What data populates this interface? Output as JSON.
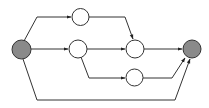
{
  "diagram": {
    "type": "directed-graph",
    "width": 209,
    "height": 108,
    "colors": {
      "stroke": "#333333",
      "terminal_fill": "#8a8a8a",
      "inner_fill": "#ffffff",
      "background": "#ffffff"
    },
    "nodes": [
      {
        "id": "source",
        "kind": "terminal",
        "cx": 21.5,
        "cy": 49.5,
        "r": 9.5
      },
      {
        "id": "n1",
        "kind": "inner",
        "cx": 80.5,
        "cy": 17,
        "r": 8.5
      },
      {
        "id": "n2",
        "kind": "inner",
        "cx": 78,
        "cy": 49,
        "r": 9
      },
      {
        "id": "n3",
        "kind": "inner",
        "cx": 135,
        "cy": 49,
        "r": 9
      },
      {
        "id": "n4",
        "kind": "inner",
        "cx": 134.5,
        "cy": 77.5,
        "r": 8.5
      },
      {
        "id": "sink",
        "kind": "terminal",
        "cx": 192,
        "cy": 49,
        "r": 9
      }
    ],
    "edges": [
      {
        "from": "source",
        "to": "n1",
        "points": "24,41 37,17 71,17"
      },
      {
        "from": "source",
        "to": "n2",
        "points": "31,49 68,49"
      },
      {
        "from": "source",
        "to": "sink",
        "points": "23,59 37,100 175,100 190,59"
      },
      {
        "from": "n1",
        "to": "n3",
        "points": "89,17 125,17 133,39"
      },
      {
        "from": "n2",
        "to": "n3",
        "points": "87,49 125,49"
      },
      {
        "from": "n2",
        "to": "n4",
        "points": "81,57 89,78 125,78"
      },
      {
        "from": "n3",
        "to": "sink",
        "points": "144,49 182,49"
      },
      {
        "from": "n4",
        "to": "sink",
        "points": "143,78 172,78 185,58"
      }
    ]
  }
}
